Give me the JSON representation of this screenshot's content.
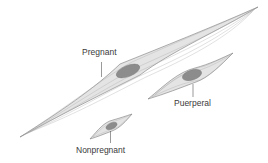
{
  "diagram": {
    "type": "smooth muscle cell size comparison",
    "colors": {
      "background": "#ffffff",
      "cell_fill": "#e4e4e4",
      "cell_stroke": "#7a7a7a",
      "fiber_lines": "#a8a8a8",
      "nucleus_fill": "#8c8c8c",
      "label_text": "#3a3a3a"
    },
    "cells": [
      {
        "id": "pregnant",
        "label": "Pregnant",
        "size": "large"
      },
      {
        "id": "puerperal",
        "label": "Puerperal",
        "size": "medium"
      },
      {
        "id": "nonpregnant",
        "label": "Nonpregnant",
        "size": "small"
      }
    ]
  }
}
